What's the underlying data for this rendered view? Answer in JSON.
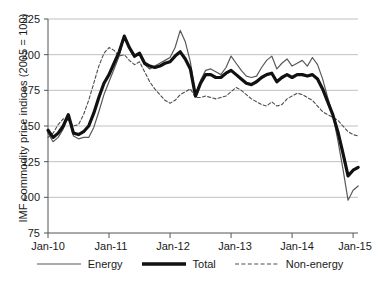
{
  "chart_data": {
    "type": "line",
    "title": "",
    "xlabel": "",
    "ylabel": "IMF commodity price indices (2005 = 100)",
    "ylim": [
      75,
      225
    ],
    "yticks": [
      75,
      100,
      125,
      150,
      175,
      200,
      225
    ],
    "xticks": [
      "Jan-10",
      "Jan-11",
      "Jan-12",
      "Jan-13",
      "Jan-14",
      "Jan-15"
    ],
    "xlim": [
      2010.0,
      2015.08
    ],
    "grid": "horizontal",
    "legend_position": "bottom",
    "x": [
      2010.0,
      2010.083,
      2010.167,
      2010.25,
      2010.333,
      2010.417,
      2010.5,
      2010.583,
      2010.667,
      2010.75,
      2010.833,
      2010.917,
      2011.0,
      2011.083,
      2011.167,
      2011.25,
      2011.333,
      2011.417,
      2011.5,
      2011.583,
      2011.667,
      2011.75,
      2011.833,
      2011.917,
      2012.0,
      2012.083,
      2012.167,
      2012.25,
      2012.333,
      2012.417,
      2012.5,
      2012.583,
      2012.667,
      2012.75,
      2012.833,
      2012.917,
      2013.0,
      2013.083,
      2013.167,
      2013.25,
      2013.333,
      2013.417,
      2013.5,
      2013.583,
      2013.667,
      2013.75,
      2013.833,
      2013.917,
      2014.0,
      2014.083,
      2014.167,
      2014.25,
      2014.333,
      2014.417,
      2014.5,
      2014.583,
      2014.667,
      2014.75,
      2014.833,
      2014.917,
      2015.0,
      2015.083
    ],
    "series": [
      {
        "name": "Energy",
        "style": "thin-solid",
        "color": "#595959",
        "values": [
          145,
          139,
          142,
          148,
          158,
          143,
          141,
          142,
          142,
          149,
          160,
          172,
          181,
          190,
          199,
          213,
          204,
          198,
          201,
          193,
          190,
          192,
          194,
          196,
          198,
          205,
          217,
          209,
          195,
          172,
          182,
          189,
          190,
          188,
          186,
          191,
          199,
          194,
          189,
          185,
          184,
          185,
          191,
          196,
          199,
          190,
          194,
          197,
          192,
          194,
          196,
          192,
          198,
          193,
          183,
          170,
          158,
          140,
          120,
          98,
          105,
          108
        ]
      },
      {
        "name": "Total",
        "style": "thick-solid",
        "color": "#111111",
        "values": [
          147,
          142,
          145,
          150,
          158,
          145,
          144,
          146,
          150,
          159,
          170,
          180,
          186,
          194,
          202,
          213,
          205,
          199,
          201,
          194,
          192,
          191,
          192,
          194,
          195,
          199,
          202,
          197,
          190,
          171,
          180,
          186,
          186,
          184,
          184,
          187,
          189,
          186,
          183,
          180,
          179,
          181,
          184,
          186,
          187,
          181,
          184,
          186,
          184,
          186,
          186,
          185,
          186,
          183,
          176,
          167,
          158,
          146,
          131,
          115,
          119,
          121
        ]
      },
      {
        "name": "Non-energy",
        "style": "dashed",
        "color": "#4d4d4d",
        "values": [
          142,
          145,
          151,
          155,
          154,
          150,
          151,
          158,
          168,
          180,
          192,
          201,
          205,
          203,
          199,
          200,
          196,
          193,
          195,
          188,
          181,
          176,
          172,
          168,
          166,
          168,
          172,
          174,
          176,
          170,
          170,
          171,
          170,
          169,
          170,
          171,
          174,
          177,
          175,
          172,
          169,
          167,
          165,
          164,
          167,
          164,
          165,
          169,
          171,
          173,
          172,
          170,
          168,
          164,
          160,
          158,
          156,
          154,
          150,
          146,
          144,
          143
        ]
      }
    ]
  },
  "legend": {
    "items": [
      {
        "label": "Energy"
      },
      {
        "label": "Total"
      },
      {
        "label": "Non-energy"
      }
    ]
  },
  "axis": {
    "y_title": "IMF commodity price indices (2005 = 100)",
    "y_labels": [
      "225",
      "200",
      "175",
      "150",
      "125",
      "100",
      "75"
    ],
    "x_labels": [
      "Jan-10",
      "Jan-11",
      "Jan-12",
      "Jan-13",
      "Jan-14",
      "Jan-15"
    ]
  }
}
